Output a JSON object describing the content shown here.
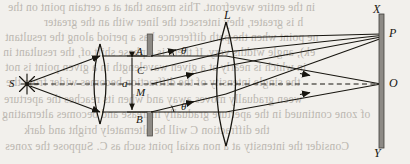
{
  "figure": {
    "background_color": "#f2f0ec",
    "ink_color": "#17150f",
    "barrier_color": "#8d8a85",
    "bleed_text_color": "#b9b5ae"
  },
  "labels": {
    "source": "S",
    "lens": "L",
    "slit_top": "A",
    "slit_upper_mid": "C",
    "slit_mid": "M",
    "slit_bottom": "B",
    "slit_width": "a",
    "angle_upper": "θ",
    "angle_lower": "θ",
    "screen_top": "X",
    "screen_bottom": "Y",
    "point_p": "P",
    "point_o": "O"
  },
  "components": {
    "source_icon": "starburst-point-source",
    "collimating_lens_icon": "biconvex-lens",
    "focusing_lens_icon": "biconvex-lens",
    "barrier_icon": "opaque-screen-with-slit",
    "screen_icon": "observation-screen",
    "axis_style": "dashed-optical-axis",
    "slit_width_marker": "double-headed-arrow"
  },
  "bleed_lines": [
    {
      "text": "in the entire wavefront. This means that at a certain point on the",
      "x": 8,
      "y": 1
    },
    {
      "text": "h is greater, they intersect the liner with an the   greater",
      "x": 44,
      "y": 16
    },
    {
      "text": "ne point when the path difference has a period along the resultant",
      "x": 5,
      "y": 31
    },
    {
      "text": "ek), angle widths very. If there is a phase shift of, the resultant in",
      "x": 3,
      "y": 46
    },
    {
      "text": "in which is nearly at a given wavelength in a given point is not",
      "x": 5,
      "y": 61
    },
    {
      "text": "the single intensity of the diffraction becomes wider from the",
      "x": 6,
      "y": 76
    },
    {
      "text": "ween gradually moves away and when its reaches the aperture",
      "x": 4,
      "y": 93
    },
    {
      "text": "of zone continued in the aperture gradually increase and becomes alternating",
      "x": 2,
      "y": 108
    },
    {
      "text": "the diffraction C will be alternately bright and dark",
      "x": 24,
      "y": 124
    },
    {
      "text": "Consider the intensity at a non axial point such as  C. Suppose the zones",
      "x": 5,
      "y": 140
    }
  ],
  "geometry": {
    "axis_y": 84,
    "source_x": 22,
    "lens1_x": 100,
    "barrier_x": 150,
    "lens2_x": 226,
    "screen_x": 382,
    "slit_top_y": 56,
    "slit_bottom_y": 112,
    "point_p_y": 34,
    "point_o_y": 84
  }
}
